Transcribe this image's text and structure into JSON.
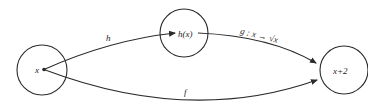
{
  "diagram": {
    "type": "mapping-diagram",
    "nodes": [
      {
        "id": "x",
        "label": "x"
      },
      {
        "id": "hx",
        "label": "h(x)"
      },
      {
        "id": "x2",
        "label": "x+2"
      }
    ],
    "edges": [
      {
        "id": "h",
        "from": "x",
        "to": "hx",
        "label": "h"
      },
      {
        "id": "g",
        "from": "hx",
        "to": "x2",
        "label": "g : x → √x"
      },
      {
        "id": "f",
        "from": "x",
        "to": "x2",
        "label": "f"
      }
    ]
  },
  "colors": {
    "stroke": "#2b2b2b",
    "background": "#ffffff"
  }
}
